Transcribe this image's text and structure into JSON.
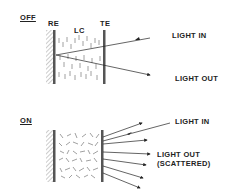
{
  "diagram": {
    "off_panel": {
      "state_label": "OFF",
      "electrode_labels": {
        "reflective": "RE",
        "liquid_crystal": "LC",
        "transparent": "TE"
      },
      "light_in": "LIGHT IN",
      "light_out": "LIGHT OUT"
    },
    "on_panel": {
      "state_label": "ON",
      "light_in": "LIGHT IN",
      "light_out_line1": "LIGHT OUT",
      "light_out_line2": "(SCATTERED)"
    },
    "colors": {
      "ink": "#222222",
      "electrode": "#555555",
      "hatch": "#999999",
      "background": "#ffffff"
    }
  }
}
